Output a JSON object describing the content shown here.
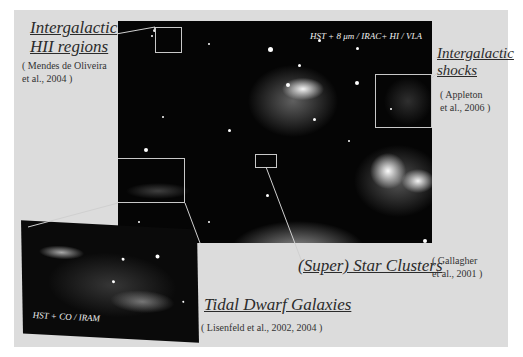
{
  "figure": {
    "image_label": "HST + 8 μm / IRAC+  HI / VLA",
    "inset_label": "HST + CO / IRAM",
    "colors": {
      "panel": "#dcdcdc",
      "page": "#ffffff",
      "image_background": "#050505",
      "highlight_box": "#c8c8c8",
      "text": "#2b2b2b"
    }
  },
  "annotations": [
    {
      "id": "intergalactic-hii",
      "title_lines": [
        "Intergalactic",
        "HII regions"
      ],
      "citation_lines": [
        "( Mendes de Oliveira",
        "et al., 2004 )"
      ]
    },
    {
      "id": "intergalactic-shocks",
      "title_lines": [
        "Intergalactic",
        "shocks"
      ],
      "citation_lines": [
        "( Appleton",
        "et al., 2006 )"
      ]
    },
    {
      "id": "super-star-clusters",
      "title_lines": [
        "(Super) Star Clusters"
      ],
      "citation_lines": [
        "( Gallagher",
        "et al., 2001 )"
      ]
    },
    {
      "id": "tidal-dwarf-galaxies",
      "title_lines": [
        "Tidal Dwarf Galaxies"
      ],
      "citation_lines": [
        "( Lisenfeld et al., 2002, 2004 )"
      ]
    }
  ]
}
